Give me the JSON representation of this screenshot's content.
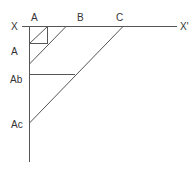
{
  "diagram": {
    "type": "geometric-construction",
    "line_color": "#555555",
    "label_color": "#333333",
    "labels": {
      "x_left": "X",
      "x_right": "X'",
      "top_a": "A",
      "top_b": "B",
      "top_c": "C",
      "side_a": "A",
      "side_ab": "Ab",
      "side_ac": "Ac"
    },
    "lines": [
      {
        "name": "axis-xx",
        "x1": 22,
        "y1": 26,
        "x2": 177,
        "y2": 26
      },
      {
        "name": "vertical-axis",
        "x1": 29,
        "y1": 26,
        "x2": 29,
        "y2": 162
      },
      {
        "name": "square-right",
        "x1": 47,
        "y1": 26,
        "x2": 47,
        "y2": 43
      },
      {
        "name": "square-bottom",
        "x1": 29,
        "y1": 43,
        "x2": 47,
        "y2": 43
      },
      {
        "name": "diagonal-a",
        "x1": 47,
        "y1": 26,
        "x2": 29,
        "y2": 43
      },
      {
        "name": "diagonal-b",
        "x1": 66,
        "y1": 26,
        "x2": 29,
        "y2": 64
      },
      {
        "name": "horizontal-ab",
        "x1": 29,
        "y1": 74,
        "x2": 75,
        "y2": 74
      },
      {
        "name": "diagonal-c",
        "x1": 123,
        "y1": 26,
        "x2": 29,
        "y2": 123
      }
    ]
  }
}
